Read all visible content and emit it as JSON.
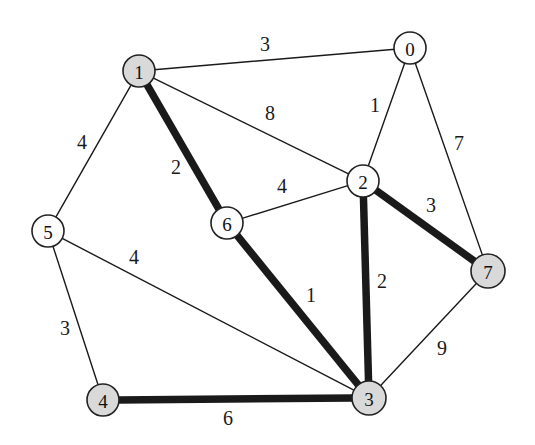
{
  "figure": {
    "background": "#ffffff"
  },
  "chart_data": {
    "type": "diagram",
    "subtype": "weighted-undirected-graph",
    "title": "",
    "xlabel": "",
    "ylabel": "",
    "grid": false,
    "legend": null,
    "colors": {
      "node_highlight_fill": "#d9d9d9",
      "node_plain_fill": "#fdfdfd",
      "node_stroke": "#222222",
      "edge_color": "#1a1a1a",
      "background": "#ffffff"
    },
    "nodes": [
      {
        "id": "n0",
        "label": "0",
        "x": 410,
        "y": 48,
        "r": 16,
        "fill": "white"
      },
      {
        "id": "n1",
        "label": "1",
        "x": 139,
        "y": 71,
        "r": 16,
        "fill": "gray"
      },
      {
        "id": "n2",
        "label": "2",
        "x": 363,
        "y": 181,
        "r": 16,
        "fill": "white"
      },
      {
        "id": "n3",
        "label": "3",
        "x": 369,
        "y": 398,
        "r": 17,
        "fill": "gray"
      },
      {
        "id": "n4",
        "label": "4",
        "x": 103,
        "y": 400,
        "r": 16,
        "fill": "gray"
      },
      {
        "id": "n5",
        "label": "5",
        "x": 48,
        "y": 231,
        "r": 16,
        "fill": "white"
      },
      {
        "id": "n6",
        "label": "6",
        "x": 227,
        "y": 223,
        "r": 16,
        "fill": "white"
      },
      {
        "id": "n7",
        "label": "7",
        "x": 488,
        "y": 271,
        "r": 17,
        "fill": "gray"
      }
    ],
    "edges": [
      {
        "id": "e-1-0",
        "source": "n1",
        "target": "n0",
        "weight": "3",
        "thick": false,
        "label_x": 265,
        "label_y": 44
      },
      {
        "id": "e-1-5",
        "source": "n1",
        "target": "n5",
        "weight": "4",
        "thick": false,
        "label_x": 82,
        "label_y": 142
      },
      {
        "id": "e-1-6",
        "source": "n1",
        "target": "n6",
        "weight": "2",
        "thick": true,
        "label_x": 176,
        "label_y": 167
      },
      {
        "id": "e-1-2",
        "source": "n1",
        "target": "n2",
        "weight": "8",
        "thick": false,
        "label_x": 270,
        "label_y": 113
      },
      {
        "id": "e-0-2",
        "source": "n0",
        "target": "n2",
        "weight": "1",
        "thick": false,
        "label_x": 375,
        "label_y": 105
      },
      {
        "id": "e-0-7",
        "source": "n0",
        "target": "n7",
        "weight": "7",
        "thick": false,
        "label_x": 459,
        "label_y": 143
      },
      {
        "id": "e-2-6",
        "source": "n2",
        "target": "n6",
        "weight": "4",
        "thick": false,
        "label_x": 282,
        "label_y": 186
      },
      {
        "id": "e-2-7",
        "source": "n2",
        "target": "n7",
        "weight": "3",
        "thick": true,
        "label_x": 431,
        "label_y": 205
      },
      {
        "id": "e-2-3",
        "source": "n2",
        "target": "n3",
        "weight": "2",
        "thick": true,
        "label_x": 382,
        "label_y": 281
      },
      {
        "id": "e-6-3",
        "source": "n6",
        "target": "n3",
        "weight": "1",
        "thick": true,
        "label_x": 311,
        "label_y": 295
      },
      {
        "id": "e-5-3",
        "source": "n5",
        "target": "n3",
        "weight": "4",
        "thick": false,
        "label_x": 134,
        "label_y": 257
      },
      {
        "id": "e-5-4",
        "source": "n5",
        "target": "n4",
        "weight": "3",
        "thick": false,
        "label_x": 65,
        "label_y": 328
      },
      {
        "id": "e-4-3",
        "source": "n4",
        "target": "n3",
        "weight": "6",
        "thick": true,
        "label_x": 228,
        "label_y": 418
      },
      {
        "id": "e-7-3",
        "source": "n7",
        "target": "n3",
        "weight": "9",
        "thick": false,
        "label_x": 442,
        "label_y": 348
      }
    ]
  }
}
